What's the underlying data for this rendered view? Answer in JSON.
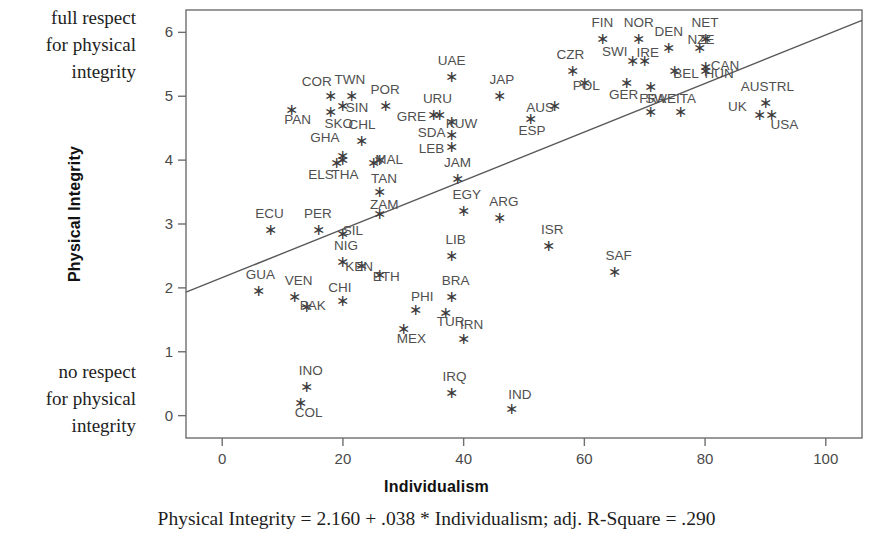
{
  "annotations": {
    "top_note": "full respect\nfor physical\nintegrity",
    "bottom_note": "no respect\nfor physical\nintegrity"
  },
  "caption": "Physical Integrity = 2.160 + .038 * Individualism; adj. R-Square = .290",
  "axes": {
    "x_title": "Individualism",
    "y_title": "Physical Integrity",
    "x_ticks": [
      "0",
      "20",
      "40",
      "60",
      "80",
      "100"
    ],
    "y_ticks": [
      "0",
      "1",
      "2",
      "3",
      "4",
      "5",
      "6"
    ]
  },
  "colors": {
    "axis": "#6e6e6e",
    "marker": "#3c3c3c",
    "label": "#4f4f4f",
    "line": "#5a5a5a",
    "background": "#ffffff"
  },
  "chart_data": {
    "type": "scatter",
    "title": "",
    "xlabel": "Individualism",
    "ylabel": "Physical Integrity",
    "xlim": [
      -6,
      106
    ],
    "ylim": [
      -0.35,
      6.35
    ],
    "grid": false,
    "legend": "none",
    "annotations": [
      "full respect for physical integrity",
      "no respect for physical integrity",
      "Physical Integrity = 2.160 + .038 * Individualism; adj. R-Square = .290"
    ],
    "fit_line": {
      "intercept": 2.16,
      "slope": 0.038,
      "adj_r_square": 0.29,
      "equation": "Physical Integrity = 2.160 + .038 * Individualism"
    },
    "points": [
      {
        "label": "COR",
        "x": 18.0,
        "y": 5.0,
        "lx": -14,
        "ly": -10
      },
      {
        "label": "TWN",
        "x": 21.5,
        "y": 5.0,
        "lx": -2,
        "ly": -12
      },
      {
        "label": "SIN",
        "x": 20.0,
        "y": 4.85,
        "lx": 14,
        "ly": 6
      },
      {
        "label": "PAN",
        "x": 11.5,
        "y": 4.78,
        "lx": 6,
        "ly": 14
      },
      {
        "label": "SKO",
        "x": 18.0,
        "y": 4.75,
        "lx": 8,
        "ly": 16
      },
      {
        "label": "POR",
        "x": 27.0,
        "y": 4.85,
        "lx": 0,
        "ly": -12
      },
      {
        "label": "GHA",
        "x": 20.0,
        "y": 4.06,
        "lx": -18,
        "ly": -14
      },
      {
        "label": "CHL",
        "x": 23.0,
        "y": 4.3,
        "lx": 1,
        "ly": -12
      },
      {
        "label": "GRE",
        "x": 35.0,
        "y": 4.7,
        "lx": -22,
        "ly": 6
      },
      {
        "label": "URU",
        "x": 36.0,
        "y": 4.7,
        "lx": -2,
        "ly": -12
      },
      {
        "label": "KUW",
        "x": 38.0,
        "y": 4.6,
        "lx": 10,
        "ly": 6
      },
      {
        "label": "SDA",
        "x": 38.0,
        "y": 4.4,
        "lx": -20,
        "ly": 2
      },
      {
        "label": "LEB",
        "x": 38.0,
        "y": 4.2,
        "lx": -20,
        "ly": 6
      },
      {
        "label": "ELS",
        "x": 19.0,
        "y": 3.95,
        "lx": -16,
        "ly": 16
      },
      {
        "label": "THA",
        "x": 20.0,
        "y": 4.0,
        "lx": 2,
        "ly": 19
      },
      {
        "label": "MAL",
        "x": 26.0,
        "y": 4.0,
        "lx": 10,
        "ly": 4
      },
      {
        "label": "TAN",
        "x": 25.0,
        "y": 3.95,
        "lx": 11,
        "ly": 20
      },
      {
        "label": "UAE",
        "x": 38.0,
        "y": 5.3,
        "lx": 0,
        "ly": -12
      },
      {
        "label": "JAP",
        "x": 46.0,
        "y": 5.0,
        "lx": 2,
        "ly": -12
      },
      {
        "label": "AUS",
        "x": 55.0,
        "y": 4.85,
        "lx": -14,
        "ly": 6
      },
      {
        "label": "ESP",
        "x": 51.0,
        "y": 4.65,
        "lx": 2,
        "ly": 16
      },
      {
        "label": "CZR",
        "x": 58.0,
        "y": 5.4,
        "lx": -2,
        "ly": -12
      },
      {
        "label": "POL",
        "x": 60.0,
        "y": 5.2,
        "lx": 2,
        "ly": 7
      },
      {
        "label": "FIN",
        "x": 63.0,
        "y": 5.9,
        "lx": 0,
        "ly": -12
      },
      {
        "label": "SWI",
        "x": 68.0,
        "y": 5.55,
        "lx": -18,
        "ly": -5
      },
      {
        "label": "NOR",
        "x": 69.0,
        "y": 5.9,
        "lx": 0,
        "ly": -12
      },
      {
        "label": "IRE",
        "x": 70.0,
        "y": 5.55,
        "lx": 3,
        "ly": -4
      },
      {
        "label": "DEN",
        "x": 74.0,
        "y": 5.75,
        "lx": 0,
        "ly": -12
      },
      {
        "label": "NZE",
        "x": 79.0,
        "y": 5.75,
        "lx": 2,
        "ly": -4
      },
      {
        "label": "NET",
        "x": 80.0,
        "y": 5.9,
        "lx": 0,
        "ly": -12
      },
      {
        "label": "GER",
        "x": 67.0,
        "y": 5.2,
        "lx": -3,
        "ly": 16
      },
      {
        "label": "SWE",
        "x": 71.0,
        "y": 5.15,
        "lx": 10,
        "ly": 16
      },
      {
        "label": "BEL",
        "x": 75.0,
        "y": 5.4,
        "lx": 11,
        "ly": 7
      },
      {
        "label": "HUN",
        "x": 80.0,
        "y": 5.4,
        "lx": 14,
        "ly": 7
      },
      {
        "label": "CAN",
        "x": 80.0,
        "y": 5.45,
        "lx": 20,
        "ly": 3
      },
      {
        "label": "FRA",
        "x": 71.0,
        "y": 4.75,
        "lx": 2,
        "ly": -9
      },
      {
        "label": "ITA",
        "x": 76.0,
        "y": 4.75,
        "lx": 5,
        "ly": -9
      },
      {
        "label": "AUSTRL",
        "x": 90.0,
        "y": 4.9,
        "lx": 2,
        "ly": -12
      },
      {
        "label": "UK",
        "x": 89.0,
        "y": 4.7,
        "lx": -22,
        "ly": -4
      },
      {
        "label": "USA",
        "x": 91.0,
        "y": 4.7,
        "lx": 13,
        "ly": 14
      },
      {
        "label": "JAM",
        "x": 39.0,
        "y": 3.7,
        "lx": 0,
        "ly": -12
      },
      {
        "label": "ZAM",
        "x": 26.0,
        "y": 3.5,
        "lx": 5,
        "ly": 17
      },
      {
        "label": "ECU",
        "x": 8.0,
        "y": 2.9,
        "lx": -1,
        "ly": -12
      },
      {
        "label": "PER",
        "x": 16.0,
        "y": 2.9,
        "lx": -1,
        "ly": -12
      },
      {
        "label": "SIL",
        "x": 20.0,
        "y": 2.85,
        "lx": 10,
        "ly": 1
      },
      {
        "label": "ZAM2",
        "x": 26.0,
        "y": 3.15,
        "lx": 0,
        "ly": -100
      },
      {
        "label": "EGY",
        "x": 40.0,
        "y": 3.2,
        "lx": 3,
        "ly": -12
      },
      {
        "label": "ARG",
        "x": 46.0,
        "y": 3.1,
        "lx": 4,
        "ly": -12
      },
      {
        "label": "ISR",
        "x": 54.0,
        "y": 2.65,
        "lx": 4,
        "ly": -12
      },
      {
        "label": "SAF",
        "x": 65.0,
        "y": 2.25,
        "lx": 4,
        "ly": -12
      },
      {
        "label": "LIB",
        "x": 38.0,
        "y": 2.5,
        "lx": 4,
        "ly": -12
      },
      {
        "label": "NIG",
        "x": 20.0,
        "y": 2.4,
        "lx": 3,
        "ly": -12
      },
      {
        "label": "KEN",
        "x": 23.0,
        "y": 2.35,
        "lx": -2,
        "ly": 5
      },
      {
        "label": "ETH",
        "x": 26.0,
        "y": 2.2,
        "lx": 7,
        "ly": 6
      },
      {
        "label": "GUA",
        "x": 6.0,
        "y": 1.95,
        "lx": 2,
        "ly": -12
      },
      {
        "label": "VEN",
        "x": 12.0,
        "y": 1.85,
        "lx": 4,
        "ly": -12
      },
      {
        "label": "PAK",
        "x": 14.0,
        "y": 1.7,
        "lx": 6,
        "ly": 3
      },
      {
        "label": "CHI",
        "x": 20.0,
        "y": 1.8,
        "lx": -3,
        "ly": -9
      },
      {
        "label": "PHI",
        "x": 32.0,
        "y": 1.65,
        "lx": 7,
        "ly": -9
      },
      {
        "label": "BRA",
        "x": 38.0,
        "y": 1.85,
        "lx": 4,
        "ly": -12
      },
      {
        "label": "TUR",
        "x": 37.0,
        "y": 1.6,
        "lx": 5,
        "ly": 13
      },
      {
        "label": "IRN",
        "x": 40.0,
        "y": 1.2,
        "lx": 8,
        "ly": -10
      },
      {
        "label": "MEX",
        "x": 30.0,
        "y": 1.35,
        "lx": 8,
        "ly": 14
      },
      {
        "label": "INO",
        "x": 14.0,
        "y": 0.45,
        "lx": 4,
        "ly": -12
      },
      {
        "label": "COL",
        "x": 13.0,
        "y": 0.2,
        "lx": 8,
        "ly": 14
      },
      {
        "label": "IRQ",
        "x": 38.0,
        "y": 0.35,
        "lx": 3,
        "ly": -12
      },
      {
        "label": "IND",
        "x": 48.0,
        "y": 0.1,
        "lx": 8,
        "ly": -10
      }
    ]
  }
}
